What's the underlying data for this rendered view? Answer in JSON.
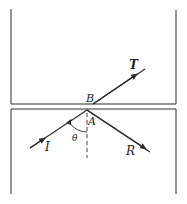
{
  "diagram": {
    "labels": {
      "transmitted": "T",
      "incident": "I",
      "reflected": "R",
      "point_b": "B",
      "point_a": "A",
      "angle": "θ"
    },
    "colors": {
      "line": "#2a2a2a",
      "background": "#ffffff"
    },
    "geometry": {
      "upper_block": {
        "left": 11,
        "right": 176,
        "top": 9,
        "bottom": 104
      },
      "lower_block": {
        "left": 11,
        "right": 176,
        "top": 109,
        "bottom": 194
      },
      "incident_ray": {
        "from": [
          30,
          148
        ],
        "to": [
          87,
          110
        ]
      },
      "reflected_ray": {
        "from": [
          87,
          110
        ],
        "to": [
          150,
          152
        ]
      },
      "transmitted_ray": {
        "from": [
          93,
          104
        ],
        "to": [
          145,
          69
        ]
      },
      "normal": {
        "from": [
          87,
          113
        ],
        "to": [
          87,
          158
        ]
      }
    }
  }
}
